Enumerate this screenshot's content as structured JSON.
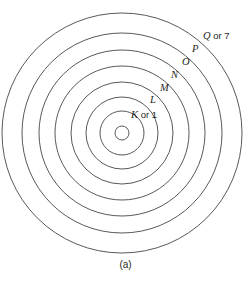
{
  "figure": {
    "caption": "(a)",
    "background_color": "#ffffff",
    "stroke_color": "#59595b",
    "text_color": "#231f20"
  },
  "diagram": {
    "type": "concentric-shell-diagram",
    "center": {
      "x": 122,
      "y": 133
    },
    "nucleus": {
      "radius": 7
    },
    "shells": [
      {
        "index": 1,
        "symbol": "K",
        "suffix": " or 1",
        "label": "K or 1",
        "radius": 22,
        "label_x": 131,
        "label_y": 110
      },
      {
        "index": 2,
        "symbol": "L",
        "suffix": "",
        "label": "L",
        "radius": 36,
        "label_x": 150,
        "label_y": 95
      },
      {
        "index": 3,
        "symbol": "M",
        "suffix": "",
        "label": "M",
        "radius": 51,
        "label_x": 160,
        "label_y": 83
      },
      {
        "index": 4,
        "symbol": "N",
        "suffix": "",
        "label": "N",
        "radius": 67,
        "label_x": 171,
        "label_y": 70
      },
      {
        "index": 5,
        "symbol": "O",
        "suffix": "",
        "label": "O",
        "radius": 83,
        "label_x": 182,
        "label_y": 57
      },
      {
        "index": 6,
        "symbol": "P",
        "suffix": "",
        "label": "P",
        "radius": 100,
        "label_x": 192,
        "label_y": 44
      },
      {
        "index": 7,
        "symbol": "Q",
        "suffix": " or 7",
        "label": "Q or 7",
        "radius": 120,
        "label_x": 203,
        "label_y": 31
      }
    ]
  }
}
